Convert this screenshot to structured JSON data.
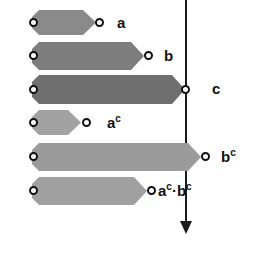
{
  "figure": {
    "width": 256,
    "height": 260,
    "background": "#ffffff"
  },
  "axis": {
    "name": "threshold-arrow",
    "orientation": "vertical",
    "direction": "down",
    "x": 186,
    "top": 0,
    "bottom": 235,
    "color": "#1a1a1a",
    "shaft_width": 2,
    "arrowhead": true
  },
  "bars": [
    {
      "id": "bar-a",
      "label": "a",
      "label_base": "a",
      "label_sup": "",
      "x": 32,
      "y": 10,
      "width": 64,
      "height": 25,
      "fill": "#8a8a8a",
      "left_endpoint_x": 30,
      "right_endpoint_x": 97,
      "label_x": 117,
      "crosses_axis": false
    },
    {
      "id": "bar-b",
      "label": "b",
      "label_base": "b",
      "label_sup": "",
      "x": 32,
      "y": 42,
      "width": 112,
      "height": 28,
      "fill": "#7d7d7d",
      "left_endpoint_x": 30,
      "right_endpoint_x": 146,
      "label_x": 164,
      "crosses_axis": false
    },
    {
      "id": "bar-c",
      "label": "c",
      "label_base": "c",
      "label_sup": "",
      "x": 32,
      "y": 75,
      "width": 153,
      "height": 29,
      "fill": "#6f6f6f",
      "left_endpoint_x": 30,
      "right_endpoint_x": 182,
      "label_x": 212,
      "crosses_axis": true
    },
    {
      "id": "bar-a-c",
      "label": "aᶜ",
      "label_base": "a",
      "label_sup": "c",
      "x": 32,
      "y": 110,
      "width": 49,
      "height": 25,
      "fill": "#a2a2a2",
      "left_endpoint_x": 30,
      "right_endpoint_x": 84,
      "label_x": 107,
      "crosses_axis": false
    },
    {
      "id": "bar-b-c",
      "label": "bᶜ",
      "label_base": "b",
      "label_sup": "c",
      "x": 32,
      "y": 143,
      "width": 169,
      "height": 28,
      "fill": "#9b9b9b",
      "left_endpoint_x": 30,
      "right_endpoint_x": 203,
      "label_x": 221,
      "crosses_axis": true
    },
    {
      "id": "bar-a-c-b-c",
      "label": "aᶜ·bᶜ",
      "label_base": "a",
      "label_sup": "c",
      "label_base2": "b",
      "label_sup2": "c",
      "label_separator": "·",
      "x": 32,
      "y": 177,
      "width": 115,
      "height": 28,
      "fill": "#a0a0a0",
      "left_endpoint_x": 30,
      "right_endpoint_x": 149,
      "label_x": 158,
      "crosses_axis": false
    }
  ]
}
